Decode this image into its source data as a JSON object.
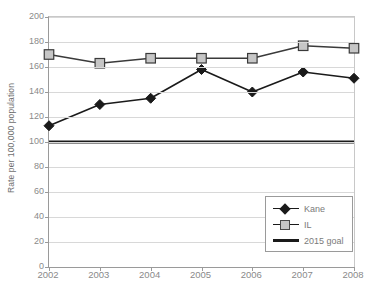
{
  "chart_data": {
    "type": "line",
    "title": "",
    "xlabel": "",
    "ylabel": "Rate per 100,000 population",
    "categories": [
      "2002",
      "2003",
      "2004",
      "2005",
      "2006",
      "2007",
      "2008"
    ],
    "ylim": [
      0,
      200
    ],
    "ytick_step": 20,
    "yticks": [
      "0",
      "20",
      "40",
      "60",
      "80",
      "100",
      "120",
      "140",
      "160",
      "180",
      "200"
    ],
    "grid": true,
    "legend_position": "bottom-right",
    "series": [
      {
        "name": "Kane",
        "marker": "diamond",
        "color": "#1a1a1a",
        "values": [
          113,
          130,
          135,
          158,
          140,
          156,
          151
        ]
      },
      {
        "name": "IL",
        "marker": "square",
        "color": "#c6c6c6",
        "line_color": "#3a3a3a",
        "values": [
          170,
          163,
          167,
          167,
          167,
          177,
          175
        ]
      },
      {
        "name": "2015 goal",
        "marker": "none",
        "color": "#1a1a1a",
        "values": [
          100,
          100,
          100,
          100,
          100,
          100,
          100
        ]
      }
    ]
  },
  "legend": {
    "items": [
      {
        "label": "Kane",
        "key": "diamond-marker-icon"
      },
      {
        "label": "IL",
        "key": "square-marker-icon"
      },
      {
        "label": "2015 goal",
        "key": "thick-line-icon"
      }
    ]
  },
  "colors": {
    "kane": "#1a1a1a",
    "il_fill": "#c6c6c6",
    "il_stroke": "#3a3a3a",
    "goal": "#1a1a1a",
    "grid": "#d8d8d8",
    "axis": "#9a9a9a",
    "tick_text": "#8a8a8a"
  }
}
